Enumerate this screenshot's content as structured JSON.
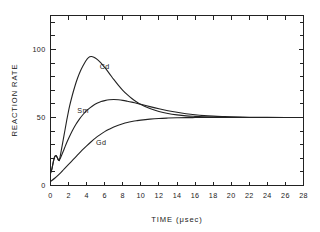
{
  "chart_data": {
    "type": "line",
    "title": "",
    "xlabel": "TIME (μsec)",
    "ylabel": "REACTION RATE",
    "xlim": [
      0,
      28
    ],
    "ylim": [
      0,
      125
    ],
    "xticks": [
      0,
      2,
      4,
      6,
      8,
      10,
      12,
      14,
      16,
      18,
      20,
      22,
      24,
      26,
      28
    ],
    "xticklabels": [
      "0",
      "2",
      "4",
      "6",
      "8",
      "10",
      "12",
      "14",
      "16",
      "18",
      "20",
      "22",
      "24",
      "26",
      "28"
    ],
    "yticks": [
      0,
      10,
      20,
      30,
      40,
      50,
      60,
      70,
      80,
      90,
      100,
      110,
      120
    ],
    "ylabeled_ticks": [
      0,
      50,
      100
    ],
    "yticklabels": [
      "0",
      "50",
      "100"
    ],
    "grid": false,
    "legend_position": "inline-curve-labels",
    "frame": "box",
    "series": [
      {
        "name": "Cd",
        "label": "Cd",
        "label_x": 6.0,
        "label_y": 86,
        "peak_x": 4.3,
        "peak_y": 95,
        "asymptote": 50,
        "points": [
          [
            0.0,
            9
          ],
          [
            0.15,
            12
          ],
          [
            0.3,
            17
          ],
          [
            0.45,
            21
          ],
          [
            0.6,
            22
          ],
          [
            0.72,
            21
          ],
          [
            0.85,
            19
          ],
          [
            0.95,
            18.5
          ],
          [
            1.0,
            19
          ],
          [
            1.2,
            26
          ],
          [
            1.5,
            37
          ],
          [
            1.8,
            48
          ],
          [
            2.1,
            58
          ],
          [
            2.4,
            66
          ],
          [
            2.7,
            73
          ],
          [
            3.0,
            79
          ],
          [
            3.3,
            84
          ],
          [
            3.6,
            88
          ],
          [
            3.9,
            91.5
          ],
          [
            4.2,
            94
          ],
          [
            4.5,
            94.8
          ],
          [
            4.8,
            94.3
          ],
          [
            5.2,
            92.6
          ],
          [
            5.6,
            90
          ],
          [
            6.0,
            86.8
          ],
          [
            6.5,
            82.5
          ],
          [
            7.0,
            78
          ],
          [
            7.5,
            73.8
          ],
          [
            8.0,
            70
          ],
          [
            8.5,
            66.8
          ],
          [
            9.0,
            64
          ],
          [
            9.5,
            61.6
          ],
          [
            10.0,
            59.6
          ],
          [
            11.0,
            56.6
          ],
          [
            12.0,
            54.4
          ],
          [
            13.0,
            52.9
          ],
          [
            14.0,
            51.9
          ],
          [
            15.0,
            51.2
          ],
          [
            16.0,
            50.8
          ],
          [
            17.0,
            50.5
          ],
          [
            18.0,
            50.3
          ],
          [
            19.0,
            50.2
          ],
          [
            20.0,
            50.1
          ],
          [
            22.0,
            50.0
          ],
          [
            24.0,
            50.0
          ],
          [
            26.0,
            50.0
          ],
          [
            28.0,
            50.0
          ]
        ]
      },
      {
        "name": "Sm",
        "label": "Sm",
        "label_x": 3.6,
        "label_y": 53,
        "peak_x": 6.8,
        "peak_y": 63,
        "asymptote": 50,
        "points": [
          [
            0.0,
            9
          ],
          [
            0.15,
            12
          ],
          [
            0.3,
            17
          ],
          [
            0.45,
            21
          ],
          [
            0.6,
            22
          ],
          [
            0.72,
            21
          ],
          [
            0.85,
            19
          ],
          [
            0.95,
            18.5
          ],
          [
            1.0,
            19
          ],
          [
            1.15,
            21
          ],
          [
            1.4,
            25
          ],
          [
            1.7,
            30
          ],
          [
            2.0,
            34.5
          ],
          [
            2.4,
            40
          ],
          [
            2.8,
            44.8
          ],
          [
            3.2,
            48.8
          ],
          [
            3.6,
            52.2
          ],
          [
            4.0,
            55.0
          ],
          [
            4.4,
            57.3
          ],
          [
            4.8,
            59.2
          ],
          [
            5.2,
            60.6
          ],
          [
            5.6,
            61.7
          ],
          [
            6.0,
            62.4
          ],
          [
            6.5,
            63.0
          ],
          [
            7.0,
            63.2
          ],
          [
            7.5,
            63.0
          ],
          [
            8.0,
            62.6
          ],
          [
            8.5,
            62.0
          ],
          [
            9.0,
            61.3
          ],
          [
            9.5,
            60.5
          ],
          [
            10.0,
            59.7
          ],
          [
            11.0,
            58.0
          ],
          [
            12.0,
            56.4
          ],
          [
            13.0,
            55.0
          ],
          [
            14.0,
            53.8
          ],
          [
            15.0,
            52.8
          ],
          [
            16.0,
            52.0
          ],
          [
            17.0,
            51.4
          ],
          [
            18.0,
            51.0
          ],
          [
            19.0,
            50.7
          ],
          [
            20.0,
            50.5
          ],
          [
            22.0,
            50.2
          ],
          [
            24.0,
            50.1
          ],
          [
            26.0,
            50.0
          ],
          [
            28.0,
            50.0
          ]
        ]
      },
      {
        "name": "Gd",
        "label": "Gd",
        "label_x": 5.6,
        "label_y": 30,
        "peak_x": null,
        "peak_y": null,
        "asymptote": 50,
        "points": [
          [
            0.0,
            3
          ],
          [
            0.5,
            5.5
          ],
          [
            1.0,
            8.5
          ],
          [
            1.5,
            12
          ],
          [
            2.0,
            15.5
          ],
          [
            2.5,
            19
          ],
          [
            3.0,
            22.5
          ],
          [
            3.5,
            26
          ],
          [
            4.0,
            29.2
          ],
          [
            4.5,
            32.2
          ],
          [
            5.0,
            35.0
          ],
          [
            5.5,
            37.4
          ],
          [
            6.0,
            39.6
          ],
          [
            6.5,
            41.4
          ],
          [
            7.0,
            43.0
          ],
          [
            7.5,
            44.3
          ],
          [
            8.0,
            45.4
          ],
          [
            8.5,
            46.3
          ],
          [
            9.0,
            47.0
          ],
          [
            9.5,
            47.6
          ],
          [
            10.0,
            48.1
          ],
          [
            11.0,
            48.8
          ],
          [
            12.0,
            49.3
          ],
          [
            13.0,
            49.6
          ],
          [
            14.0,
            49.8
          ],
          [
            15.0,
            49.9
          ],
          [
            16.0,
            49.95
          ],
          [
            17.0,
            50.0
          ],
          [
            18.0,
            50.0
          ],
          [
            20.0,
            50.0
          ],
          [
            22.0,
            50.0
          ],
          [
            24.0,
            50.0
          ],
          [
            26.0,
            50.0
          ],
          [
            28.0,
            50.0
          ]
        ]
      }
    ]
  }
}
